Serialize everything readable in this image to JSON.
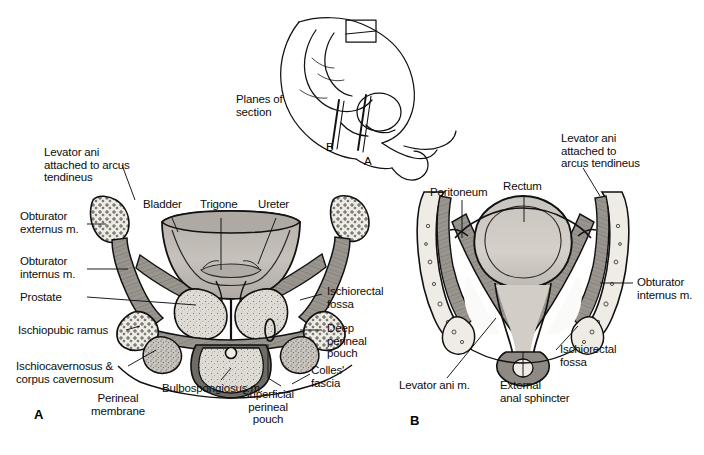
{
  "figure": {
    "title_inset": "Planes of\nsection",
    "panels": [
      {
        "id": "A",
        "letter": "A",
        "caption": "male pelvis coronal section through prostate"
      },
      {
        "id": "B",
        "letter": "B",
        "caption": "male pelvis coronal section through rectum"
      }
    ],
    "plane_markers": [
      {
        "label": "B"
      },
      {
        "label": "A"
      }
    ]
  },
  "labels_panel_a": [
    {
      "key": "levator-ani-arcus-tendineus",
      "text": "Levator ani\nattached to arcus\ntendineus"
    },
    {
      "key": "obturator-externus",
      "text": "Obturator\nexternus m."
    },
    {
      "key": "obturator-internus",
      "text": "Obturator\ninternus m."
    },
    {
      "key": "prostate",
      "text": "Prostate"
    },
    {
      "key": "ischiopubic-ramus",
      "text": "Ischiopubic ramus"
    },
    {
      "key": "ischiocavernosus-corpus-cavernosum",
      "text": "Ischiocavernosus &\ncorpus cavernosum"
    },
    {
      "key": "perineal-membrane",
      "text": "Perineal\nmembrane"
    },
    {
      "key": "bladder",
      "text": "Bladder"
    },
    {
      "key": "trigone",
      "text": "Trigone"
    },
    {
      "key": "ureter",
      "text": "Ureter"
    },
    {
      "key": "bulbospongiosus",
      "text": "Bulbospongiosus m."
    },
    {
      "key": "superficial-perineal-pouch",
      "text": "Superficial\nperineal\npouch"
    },
    {
      "key": "colles-fascia",
      "text": "Colles'\nfascia"
    },
    {
      "key": "ischiorectal-fossa-a",
      "text": "Ischiorectal\nfossa"
    },
    {
      "key": "deep-perineal-pouch",
      "text": "Deep\nperineal\npouch"
    }
  ],
  "labels_panel_b": [
    {
      "key": "peritoneum",
      "text": "Peritoneum"
    },
    {
      "key": "rectum",
      "text": "Rectum"
    },
    {
      "key": "levator-ani-arcus-tendineus-b",
      "text": "Levator ani\nattached to\narcus tendineus"
    },
    {
      "key": "obturator-internus-b",
      "text": "Obturator\ninternus m."
    },
    {
      "key": "ischiorectal-fossa-b",
      "text": "Ischiorectal\nfossa"
    },
    {
      "key": "levator-ani-m",
      "text": "Levator ani m."
    },
    {
      "key": "external-anal-sphincter",
      "text": "External\nanal sphincter"
    }
  ],
  "colors": {
    "ink": "#111111",
    "background": "#ffffff",
    "muscle_fill": "#9a968f",
    "muscle_fill_dark": "#6e6a64",
    "bone_fill": "#e8e5df",
    "organ_fill": "#b9b5ae",
    "organ_fill_light": "#cecac3",
    "gland_fill": "#dedbd4"
  }
}
